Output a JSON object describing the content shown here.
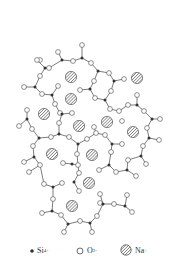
{
  "diagram": {
    "colors": {
      "bond": "#444444",
      "si": "#333333",
      "o_stroke": "#444444",
      "o_fill": "#ffffff",
      "na_hatch": "#555555"
    },
    "na": [
      [
        71,
        77
      ],
      [
        137,
        78
      ],
      [
        71,
        99
      ],
      [
        44,
        114
      ],
      [
        79,
        126
      ],
      [
        107,
        122
      ],
      [
        133,
        132
      ],
      [
        52,
        154
      ],
      [
        92,
        155
      ],
      [
        89,
        183
      ],
      [
        72,
        206
      ]
    ],
    "si": [
      [
        62,
        60
      ],
      [
        82,
        58
      ],
      [
        98,
        71
      ],
      [
        114,
        81
      ],
      [
        90,
        89
      ],
      [
        105,
        100
      ],
      [
        137,
        105
      ],
      [
        152,
        119
      ],
      [
        45,
        68
      ],
      [
        35,
        87
      ],
      [
        52,
        95
      ],
      [
        62,
        114
      ],
      [
        59,
        134
      ],
      [
        39,
        138
      ],
      [
        27,
        119
      ],
      [
        78,
        144
      ],
      [
        112,
        144
      ],
      [
        109,
        165
      ],
      [
        127,
        170
      ],
      [
        141,
        156
      ],
      [
        149,
        138
      ],
      [
        72,
        164
      ],
      [
        74,
        182
      ],
      [
        34,
        157
      ],
      [
        53,
        187
      ],
      [
        52,
        211
      ],
      [
        68,
        224
      ],
      [
        90,
        223
      ],
      [
        103,
        204
      ],
      [
        125,
        206
      ]
    ],
    "o": [
      [
        58,
        52
      ],
      [
        82,
        45
      ],
      [
        40,
        60
      ],
      [
        73,
        61
      ],
      [
        91,
        63
      ],
      [
        109,
        73
      ],
      [
        124,
        79
      ],
      [
        94,
        81
      ],
      [
        80,
        90
      ],
      [
        95,
        98
      ],
      [
        111,
        91
      ],
      [
        110,
        109
      ],
      [
        119,
        111
      ],
      [
        128,
        105
      ],
      [
        137,
        95
      ],
      [
        144,
        111
      ],
      [
        160,
        119
      ],
      [
        147,
        128
      ],
      [
        122,
        121
      ],
      [
        40,
        76
      ],
      [
        49,
        68
      ],
      [
        37,
        60
      ],
      [
        24,
        87
      ],
      [
        42,
        94
      ],
      [
        58,
        86
      ],
      [
        55,
        104
      ],
      [
        60,
        113
      ],
      [
        72,
        113
      ],
      [
        59,
        123
      ],
      [
        51,
        137
      ],
      [
        32,
        129
      ],
      [
        27,
        110
      ],
      [
        19,
        126
      ],
      [
        69,
        137
      ],
      [
        87,
        139
      ],
      [
        94,
        127
      ],
      [
        96,
        133
      ],
      [
        105,
        135
      ],
      [
        122,
        144
      ],
      [
        111,
        152
      ],
      [
        99,
        170
      ],
      [
        116,
        172
      ],
      [
        136,
        176
      ],
      [
        128,
        160
      ],
      [
        146,
        164
      ],
      [
        143,
        146
      ],
      [
        159,
        140
      ],
      [
        77,
        154
      ],
      [
        78,
        165
      ],
      [
        63,
        163
      ],
      [
        79,
        173
      ],
      [
        79,
        191
      ],
      [
        33,
        146
      ],
      [
        24,
        162
      ],
      [
        40,
        165
      ],
      [
        29,
        172
      ],
      [
        44,
        184
      ],
      [
        62,
        183
      ],
      [
        53,
        199
      ],
      [
        42,
        213
      ],
      [
        61,
        215
      ],
      [
        64,
        232
      ],
      [
        80,
        221
      ],
      [
        92,
        232
      ],
      [
        97,
        216
      ],
      [
        100,
        203
      ],
      [
        100,
        194
      ],
      [
        114,
        204
      ],
      [
        127,
        195
      ],
      [
        132,
        212
      ]
    ],
    "bonds": [
      [
        [
          62,
          60
        ],
        [
          58,
          52
        ]
      ],
      [
        [
          62,
          60
        ],
        [
          73,
          61
        ]
      ],
      [
        [
          62,
          60
        ],
        [
          49,
          68
        ]
      ],
      [
        [
          73,
          61
        ],
        [
          82,
          58
        ]
      ],
      [
        [
          82,
          58
        ],
        [
          82,
          45
        ]
      ],
      [
        [
          82,
          58
        ],
        [
          91,
          63
        ]
      ],
      [
        [
          91,
          63
        ],
        [
          98,
          71
        ]
      ],
      [
        [
          98,
          71
        ],
        [
          109,
          73
        ]
      ],
      [
        [
          98,
          71
        ],
        [
          94,
          81
        ]
      ],
      [
        [
          109,
          73
        ],
        [
          114,
          81
        ]
      ],
      [
        [
          114,
          81
        ],
        [
          124,
          79
        ]
      ],
      [
        [
          114,
          81
        ],
        [
          111,
          91
        ]
      ],
      [
        [
          94,
          81
        ],
        [
          90,
          89
        ]
      ],
      [
        [
          90,
          89
        ],
        [
          80,
          90
        ]
      ],
      [
        [
          90,
          89
        ],
        [
          95,
          98
        ]
      ],
      [
        [
          95,
          98
        ],
        [
          105,
          100
        ]
      ],
      [
        [
          105,
          100
        ],
        [
          111,
          91
        ]
      ],
      [
        [
          105,
          100
        ],
        [
          110,
          109
        ]
      ],
      [
        [
          110,
          109
        ],
        [
          119,
          111
        ]
      ],
      [
        [
          119,
          111
        ],
        [
          128,
          105
        ]
      ],
      [
        [
          128,
          105
        ],
        [
          137,
          105
        ]
      ],
      [
        [
          137,
          105
        ],
        [
          137,
          95
        ]
      ],
      [
        [
          137,
          105
        ],
        [
          144,
          111
        ]
      ],
      [
        [
          144,
          111
        ],
        [
          152,
          119
        ]
      ],
      [
        [
          152,
          119
        ],
        [
          160,
          119
        ]
      ],
      [
        [
          152,
          119
        ],
        [
          147,
          128
        ]
      ],
      [
        [
          147,
          128
        ],
        [
          149,
          138
        ]
      ],
      [
        [
          49,
          68
        ],
        [
          45,
          68
        ]
      ],
      [
        [
          45,
          68
        ],
        [
          37,
          60
        ]
      ],
      [
        [
          45,
          68
        ],
        [
          40,
          76
        ]
      ],
      [
        [
          40,
          76
        ],
        [
          35,
          87
        ]
      ],
      [
        [
          35,
          87
        ],
        [
          24,
          87
        ]
      ],
      [
        [
          35,
          87
        ],
        [
          42,
          94
        ]
      ],
      [
        [
          42,
          94
        ],
        [
          52,
          95
        ]
      ],
      [
        [
          52,
          95
        ],
        [
          58,
          86
        ]
      ],
      [
        [
          52,
          95
        ],
        [
          55,
          104
        ]
      ],
      [
        [
          55,
          104
        ],
        [
          60,
          113
        ]
      ],
      [
        [
          60,
          113
        ],
        [
          62,
          114
        ]
      ],
      [
        [
          62,
          114
        ],
        [
          72,
          113
        ]
      ],
      [
        [
          62,
          114
        ],
        [
          59,
          123
        ]
      ],
      [
        [
          59,
          123
        ],
        [
          59,
          134
        ]
      ],
      [
        [
          59,
          134
        ],
        [
          51,
          137
        ]
      ],
      [
        [
          51,
          137
        ],
        [
          39,
          138
        ]
      ],
      [
        [
          39,
          138
        ],
        [
          32,
          129
        ]
      ],
      [
        [
          32,
          129
        ],
        [
          27,
          119
        ]
      ],
      [
        [
          27,
          119
        ],
        [
          27,
          110
        ]
      ],
      [
        [
          27,
          119
        ],
        [
          19,
          126
        ]
      ],
      [
        [
          59,
          134
        ],
        [
          69,
          137
        ]
      ],
      [
        [
          69,
          137
        ],
        [
          78,
          144
        ]
      ],
      [
        [
          78,
          144
        ],
        [
          87,
          139
        ]
      ],
      [
        [
          87,
          139
        ],
        [
          96,
          133
        ]
      ],
      [
        [
          96,
          133
        ],
        [
          94,
          127
        ]
      ],
      [
        [
          96,
          133
        ],
        [
          105,
          135
        ]
      ],
      [
        [
          105,
          135
        ],
        [
          112,
          144
        ]
      ],
      [
        [
          112,
          144
        ],
        [
          122,
          144
        ]
      ],
      [
        [
          112,
          144
        ],
        [
          111,
          152
        ]
      ],
      [
        [
          111,
          152
        ],
        [
          109,
          165
        ]
      ],
      [
        [
          109,
          165
        ],
        [
          99,
          170
        ]
      ],
      [
        [
          109,
          165
        ],
        [
          116,
          172
        ]
      ],
      [
        [
          116,
          172
        ],
        [
          127,
          170
        ]
      ],
      [
        [
          127,
          170
        ],
        [
          136,
          176
        ]
      ],
      [
        [
          127,
          170
        ],
        [
          128,
          160
        ]
      ],
      [
        [
          128,
          160
        ],
        [
          141,
          156
        ]
      ],
      [
        [
          141,
          156
        ],
        [
          146,
          164
        ]
      ],
      [
        [
          141,
          156
        ],
        [
          143,
          146
        ]
      ],
      [
        [
          143,
          146
        ],
        [
          149,
          138
        ]
      ],
      [
        [
          149,
          138
        ],
        [
          159,
          140
        ]
      ],
      [
        [
          78,
          144
        ],
        [
          77,
          154
        ]
      ],
      [
        [
          77,
          154
        ],
        [
          78,
          165
        ]
      ],
      [
        [
          78,
          165
        ],
        [
          72,
          164
        ]
      ],
      [
        [
          72,
          164
        ],
        [
          63,
          163
        ]
      ],
      [
        [
          78,
          165
        ],
        [
          79,
          173
        ]
      ],
      [
        [
          79,
          173
        ],
        [
          74,
          182
        ]
      ],
      [
        [
          74,
          182
        ],
        [
          79,
          191
        ]
      ],
      [
        [
          39,
          138
        ],
        [
          33,
          146
        ]
      ],
      [
        [
          33,
          146
        ],
        [
          34,
          157
        ]
      ],
      [
        [
          34,
          157
        ],
        [
          24,
          162
        ]
      ],
      [
        [
          34,
          157
        ],
        [
          40,
          165
        ]
      ],
      [
        [
          40,
          165
        ],
        [
          44,
          184
        ]
      ],
      [
        [
          29,
          172
        ],
        [
          40,
          165
        ]
      ],
      [
        [
          44,
          184
        ],
        [
          53,
          187
        ]
      ],
      [
        [
          53,
          187
        ],
        [
          62,
          183
        ]
      ],
      [
        [
          53,
          187
        ],
        [
          53,
          199
        ]
      ],
      [
        [
          53,
          199
        ],
        [
          52,
          211
        ]
      ],
      [
        [
          52,
          211
        ],
        [
          42,
          213
        ]
      ],
      [
        [
          52,
          211
        ],
        [
          61,
          215
        ]
      ],
      [
        [
          61,
          215
        ],
        [
          68,
          224
        ]
      ],
      [
        [
          68,
          224
        ],
        [
          64,
          232
        ]
      ],
      [
        [
          68,
          224
        ],
        [
          80,
          221
        ]
      ],
      [
        [
          80,
          221
        ],
        [
          90,
          223
        ]
      ],
      [
        [
          90,
          223
        ],
        [
          92,
          232
        ]
      ],
      [
        [
          90,
          223
        ],
        [
          97,
          216
        ]
      ],
      [
        [
          97,
          216
        ],
        [
          103,
          204
        ]
      ],
      [
        [
          103,
          204
        ],
        [
          100,
          203
        ]
      ],
      [
        [
          103,
          204
        ],
        [
          100,
          194
        ]
      ],
      [
        [
          103,
          204
        ],
        [
          114,
          204
        ]
      ],
      [
        [
          114,
          204
        ],
        [
          125,
          206
        ]
      ],
      [
        [
          125,
          206
        ],
        [
          127,
          195
        ]
      ],
      [
        [
          125,
          206
        ],
        [
          132,
          212
        ]
      ]
    ]
  },
  "legend": {
    "items": [
      {
        "symbol": "filled-dot",
        "label": "Si",
        "sup": "4+"
      },
      {
        "symbol": "open-circle",
        "label": "O",
        "sup": "2-"
      },
      {
        "symbol": "hatched-circle",
        "label": "Na",
        "sup": "+"
      }
    ]
  }
}
